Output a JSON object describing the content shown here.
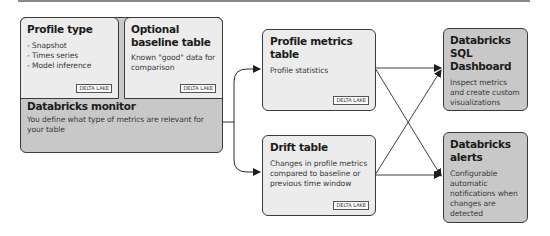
{
  "diagram": {
    "profile_type": {
      "title": "Profile type",
      "items": [
        "Snapshot",
        "Times series",
        "Model inference"
      ],
      "badge": "DELTA LAKE"
    },
    "baseline": {
      "title": "Optional baseline table",
      "text": "Known \"good\" data for comparison",
      "badge": "DELTA LAKE"
    },
    "monitor": {
      "title": "Databricks monitor",
      "text": "You define what type of metrics are relevant for your table"
    },
    "profile_metrics": {
      "title": "Profile metrics table",
      "text": "Profile statistics",
      "badge": "DELTA LAKE"
    },
    "drift": {
      "title": "Drift table",
      "text": "Changes in profile metrics compared to baseline or previous time window",
      "badge": "DELTA LAKE"
    },
    "sql_dashboard": {
      "title": "Databricks SQL Dashboard",
      "text": "Inspect metrics and create custom visualizations"
    },
    "alerts": {
      "title": "Databricks alerts",
      "text": "Configurable automatic notifications when changes are detected"
    },
    "colors": {
      "light_box": "#ececec",
      "dark_box": "#c8c8c8",
      "border": "#3a3a3a",
      "arrow": "#2a2a2a"
    }
  }
}
